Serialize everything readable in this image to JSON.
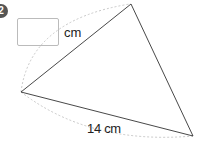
{
  "problem": {
    "number": "2",
    "answer_box_value": "",
    "answer_unit": "cm",
    "known_side_label": "14 cm",
    "colors": {
      "badge": "#555555",
      "triangle_line": "#333333",
      "arc_dashed": "#bbbbbb"
    }
  }
}
